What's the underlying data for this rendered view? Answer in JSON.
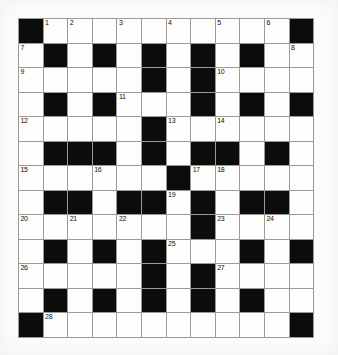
{
  "puzzle": {
    "title": "Crossword Grid",
    "rows": 13,
    "cols": 12,
    "cell_size_px": 24.6,
    "colors": {
      "block": "#0c0c0c",
      "white": "#fdfdfb",
      "grid_line": "#9a9a9a",
      "page_background": "#fbfbf9",
      "number_text": "#101010"
    },
    "grid": [
      [
        {
          "t": "block",
          "n": ""
        },
        {
          "t": "white",
          "n": "1"
        },
        {
          "t": "white",
          "n": "2"
        },
        {
          "t": "white",
          "n": ""
        },
        {
          "t": "white",
          "n": "3"
        },
        {
          "t": "white",
          "n": ""
        },
        {
          "t": "white",
          "n": "4"
        },
        {
          "t": "white",
          "n": ""
        },
        {
          "t": "white",
          "n": "5"
        },
        {
          "t": "white",
          "n": ""
        },
        {
          "t": "white",
          "n": "6"
        },
        {
          "t": "block",
          "n": ""
        }
      ],
      [
        {
          "t": "white",
          "n": "7"
        },
        {
          "t": "block",
          "n": ""
        },
        {
          "t": "white",
          "n": ""
        },
        {
          "t": "block",
          "n": ""
        },
        {
          "t": "white",
          "n": ""
        },
        {
          "t": "block",
          "n": ""
        },
        {
          "t": "white",
          "n": ""
        },
        {
          "t": "block",
          "n": ""
        },
        {
          "t": "white",
          "n": ""
        },
        {
          "t": "block",
          "n": ""
        },
        {
          "t": "white",
          "n": ""
        },
        {
          "t": "white",
          "n": "8"
        }
      ],
      [
        {
          "t": "white",
          "n": "9"
        },
        {
          "t": "white",
          "n": ""
        },
        {
          "t": "white",
          "n": ""
        },
        {
          "t": "white",
          "n": ""
        },
        {
          "t": "white",
          "n": ""
        },
        {
          "t": "block",
          "n": ""
        },
        {
          "t": "white",
          "n": ""
        },
        {
          "t": "block",
          "n": ""
        },
        {
          "t": "white",
          "n": "10"
        },
        {
          "t": "white",
          "n": ""
        },
        {
          "t": "white",
          "n": ""
        },
        {
          "t": "white",
          "n": ""
        }
      ],
      [
        {
          "t": "white",
          "n": ""
        },
        {
          "t": "block",
          "n": ""
        },
        {
          "t": "white",
          "n": ""
        },
        {
          "t": "block",
          "n": ""
        },
        {
          "t": "white",
          "n": "11"
        },
        {
          "t": "white",
          "n": ""
        },
        {
          "t": "white",
          "n": ""
        },
        {
          "t": "block",
          "n": ""
        },
        {
          "t": "white",
          "n": ""
        },
        {
          "t": "block",
          "n": ""
        },
        {
          "t": "white",
          "n": ""
        },
        {
          "t": "block",
          "n": ""
        }
      ],
      [
        {
          "t": "white",
          "n": "12"
        },
        {
          "t": "white",
          "n": ""
        },
        {
          "t": "white",
          "n": ""
        },
        {
          "t": "white",
          "n": ""
        },
        {
          "t": "white",
          "n": ""
        },
        {
          "t": "block",
          "n": ""
        },
        {
          "t": "white",
          "n": "13"
        },
        {
          "t": "white",
          "n": ""
        },
        {
          "t": "white",
          "n": "14"
        },
        {
          "t": "white",
          "n": ""
        },
        {
          "t": "white",
          "n": ""
        },
        {
          "t": "white",
          "n": ""
        }
      ],
      [
        {
          "t": "white",
          "n": ""
        },
        {
          "t": "block",
          "n": ""
        },
        {
          "t": "block",
          "n": ""
        },
        {
          "t": "block",
          "n": ""
        },
        {
          "t": "white",
          "n": ""
        },
        {
          "t": "block",
          "n": ""
        },
        {
          "t": "white",
          "n": ""
        },
        {
          "t": "block",
          "n": ""
        },
        {
          "t": "block",
          "n": ""
        },
        {
          "t": "white",
          "n": ""
        },
        {
          "t": "block",
          "n": ""
        },
        {
          "t": "white",
          "n": ""
        }
      ],
      [
        {
          "t": "white",
          "n": "15"
        },
        {
          "t": "white",
          "n": ""
        },
        {
          "t": "white",
          "n": ""
        },
        {
          "t": "white",
          "n": "16"
        },
        {
          "t": "white",
          "n": ""
        },
        {
          "t": "white",
          "n": ""
        },
        {
          "t": "block",
          "n": ""
        },
        {
          "t": "white",
          "n": "17"
        },
        {
          "t": "white",
          "n": "18"
        },
        {
          "t": "white",
          "n": ""
        },
        {
          "t": "white",
          "n": ""
        },
        {
          "t": "white",
          "n": ""
        }
      ],
      [
        {
          "t": "white",
          "n": ""
        },
        {
          "t": "block",
          "n": ""
        },
        {
          "t": "block",
          "n": ""
        },
        {
          "t": "white",
          "n": ""
        },
        {
          "t": "block",
          "n": ""
        },
        {
          "t": "block",
          "n": ""
        },
        {
          "t": "white",
          "n": "19"
        },
        {
          "t": "block",
          "n": ""
        },
        {
          "t": "white",
          "n": ""
        },
        {
          "t": "block",
          "n": ""
        },
        {
          "t": "block",
          "n": ""
        },
        {
          "t": "white",
          "n": ""
        }
      ],
      [
        {
          "t": "white",
          "n": "20"
        },
        {
          "t": "white",
          "n": ""
        },
        {
          "t": "white",
          "n": "21"
        },
        {
          "t": "white",
          "n": ""
        },
        {
          "t": "white",
          "n": "22"
        },
        {
          "t": "white",
          "n": ""
        },
        {
          "t": "white",
          "n": ""
        },
        {
          "t": "block",
          "n": ""
        },
        {
          "t": "white",
          "n": "23"
        },
        {
          "t": "white",
          "n": ""
        },
        {
          "t": "white",
          "n": "24"
        },
        {
          "t": "white",
          "n": ""
        }
      ],
      [
        {
          "t": "white",
          "n": ""
        },
        {
          "t": "block",
          "n": ""
        },
        {
          "t": "white",
          "n": ""
        },
        {
          "t": "block",
          "n": ""
        },
        {
          "t": "white",
          "n": ""
        },
        {
          "t": "block",
          "n": ""
        },
        {
          "t": "white",
          "n": "25"
        },
        {
          "t": "white",
          "n": ""
        },
        {
          "t": "white",
          "n": ""
        },
        {
          "t": "block",
          "n": ""
        },
        {
          "t": "white",
          "n": ""
        },
        {
          "t": "block",
          "n": ""
        }
      ],
      [
        {
          "t": "white",
          "n": "26"
        },
        {
          "t": "white",
          "n": ""
        },
        {
          "t": "white",
          "n": ""
        },
        {
          "t": "white",
          "n": ""
        },
        {
          "t": "white",
          "n": ""
        },
        {
          "t": "block",
          "n": ""
        },
        {
          "t": "white",
          "n": ""
        },
        {
          "t": "block",
          "n": ""
        },
        {
          "t": "white",
          "n": "27"
        },
        {
          "t": "white",
          "n": ""
        },
        {
          "t": "white",
          "n": ""
        },
        {
          "t": "white",
          "n": ""
        }
      ],
      [
        {
          "t": "white",
          "n": ""
        },
        {
          "t": "block",
          "n": ""
        },
        {
          "t": "white",
          "n": ""
        },
        {
          "t": "block",
          "n": ""
        },
        {
          "t": "white",
          "n": ""
        },
        {
          "t": "block",
          "n": ""
        },
        {
          "t": "white",
          "n": ""
        },
        {
          "t": "block",
          "n": ""
        },
        {
          "t": "white",
          "n": ""
        },
        {
          "t": "block",
          "n": ""
        },
        {
          "t": "white",
          "n": ""
        },
        {
          "t": "white",
          "n": ""
        }
      ],
      [
        {
          "t": "block",
          "n": ""
        },
        {
          "t": "white",
          "n": "28"
        },
        {
          "t": "white",
          "n": ""
        },
        {
          "t": "white",
          "n": ""
        },
        {
          "t": "white",
          "n": ""
        },
        {
          "t": "white",
          "n": ""
        },
        {
          "t": "white",
          "n": ""
        },
        {
          "t": "white",
          "n": ""
        },
        {
          "t": "white",
          "n": ""
        },
        {
          "t": "white",
          "n": ""
        },
        {
          "t": "white",
          "n": ""
        },
        {
          "t": "block",
          "n": ""
        }
      ]
    ],
    "clue_numbers": [
      "1",
      "2",
      "3",
      "4",
      "5",
      "6",
      "7",
      "8",
      "9",
      "10",
      "11",
      "12",
      "13",
      "14",
      "15",
      "16",
      "17",
      "18",
      "19",
      "20",
      "21",
      "22",
      "23",
      "24",
      "25",
      "26",
      "27",
      "28"
    ]
  }
}
